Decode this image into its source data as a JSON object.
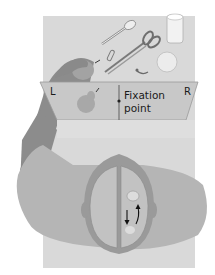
{
  "diagram": {
    "type": "split-brain experiment illustration",
    "screen": {
      "left_label": "L",
      "right_label": "R",
      "fixation_label_line1": "Fixation",
      "fixation_label_line2": "point",
      "left_field_object": "pear"
    },
    "table_objects": [
      "spoon",
      "glass",
      "scissors",
      "paper clip",
      "safety pin",
      "ball",
      "pear"
    ],
    "brain": {
      "hemispheres": [
        "left",
        "right"
      ],
      "arrows": [
        "down",
        "up"
      ]
    },
    "colors": {
      "table": "#d9d9d9",
      "screen": "#c8c8c8",
      "arm": "#8c8c8c",
      "shirt": "#b5b5b5",
      "brain": "#bdbdbd",
      "skull": "#9a9a9a"
    }
  }
}
